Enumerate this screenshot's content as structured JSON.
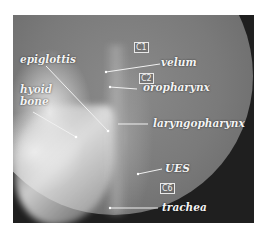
{
  "image": {
    "description": "Lateral videofluoroscopy X-ray of the pharynx with anatomical labels",
    "labels": {
      "epiglottis": "epiglottis",
      "hyoid": "hyoid\nbone",
      "hyoid_line1": "hyoid",
      "hyoid_line2": "bone",
      "velum": "velum",
      "oropharynx": "oropharynx",
      "laryngopharynx": "laryngopharynx",
      "ues": "UES",
      "trachea": "trachea"
    },
    "vertebrae": {
      "c1": "C1",
      "c2": "C2",
      "c6": "C6"
    },
    "colors": {
      "background": "#1f1f1f",
      "label": "#f4f4f4",
      "frame_border": "#ffffff"
    }
  }
}
